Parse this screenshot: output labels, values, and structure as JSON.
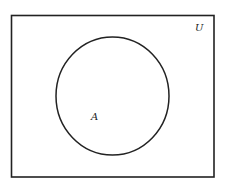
{
  "diagram": {
    "type": "venn",
    "universe": {
      "label": "U"
    },
    "sets": [
      {
        "label": "A"
      }
    ],
    "colors": {
      "stroke": "#222222",
      "background": "#ffffff"
    }
  }
}
